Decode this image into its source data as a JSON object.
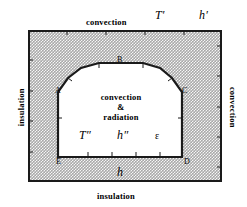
{
  "figure": {
    "colors": {
      "outline": "#1a1a1a",
      "shading": "#a9a9a9",
      "cavity_fill": "#ffffff",
      "background": "#ffffff"
    }
  },
  "boundaries": {
    "top": {
      "condition": "convection",
      "temperature_symbol": "T′",
      "coefficient_symbol": "h′"
    },
    "bottom": {
      "condition": "insulation",
      "coefficient_symbol": "h"
    },
    "left": {
      "condition": "insulation"
    },
    "right": {
      "condition": "convection"
    }
  },
  "cavity": {
    "mode_line_1": "convection",
    "mode_line_2": "&",
    "mode_line_3": "radiation",
    "temperature_symbol": "T″",
    "coefficient_symbol": "h″",
    "emissivity_symbol": "ε"
  },
  "nodes": [
    {
      "id": "A",
      "label": "A"
    },
    {
      "id": "B",
      "label": "B"
    },
    {
      "id": "C",
      "label": "C"
    },
    {
      "id": "D",
      "label": "D"
    },
    {
      "id": "E",
      "label": "E"
    }
  ],
  "geometry": {
    "outer_rect": {
      "x": 28,
      "y": 30,
      "width": 194,
      "height": 152
    },
    "cavity_points": "E(58,157) A(58,92) (68,78) (80,68) B_left(98,63) B_right(143,63) (160,68) (172,78) C(182,92) D(182,157)"
  }
}
